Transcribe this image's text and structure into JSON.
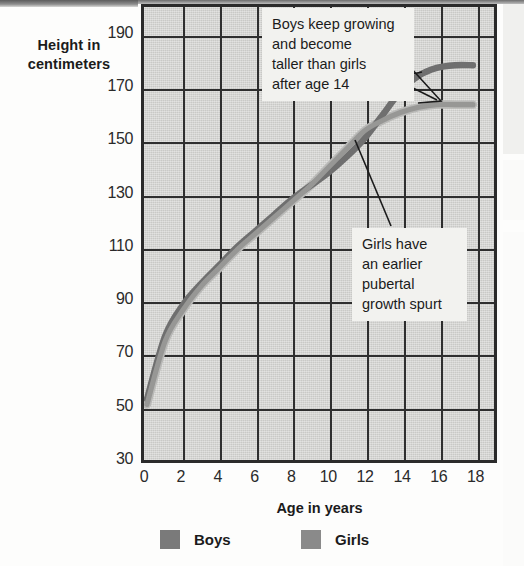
{
  "chart_data": {
    "type": "line",
    "title": "",
    "xlabel": "Age in years",
    "ylabel": "Height in centimeters",
    "xlim": [
      0,
      19
    ],
    "ylim": [
      30,
      200
    ],
    "xticks": [
      "0",
      "2",
      "4",
      "6",
      "8",
      "10",
      "12",
      "14",
      "16",
      "18"
    ],
    "yticks": [
      "190",
      "170",
      "150",
      "130",
      "110",
      "90",
      "70",
      "50",
      "30"
    ],
    "grid": true,
    "legend_position": "bottom",
    "x": [
      0,
      1,
      2,
      3,
      4,
      5,
      6,
      7,
      8,
      9,
      10,
      11,
      12,
      13,
      14,
      15,
      16,
      17,
      18
    ],
    "series": [
      {
        "name": "Boys",
        "color": "#7c7c7c",
        "values": [
          52,
          76,
          88,
          96,
          103,
          110,
          116,
          122,
          128,
          133,
          138,
          144,
          151,
          160,
          169,
          175,
          178,
          179,
          179
        ]
      },
      {
        "name": "Girls",
        "color": "#8d8d8d",
        "values": [
          50,
          74,
          86,
          95,
          102,
          109,
          115,
          121,
          127,
          133,
          140,
          147,
          154,
          158,
          161,
          163,
          164,
          164,
          164
        ]
      }
    ],
    "annotations": [
      {
        "id": "boys-note",
        "lines": [
          "Boys keep growing",
          "and become",
          "taller than girls",
          "after age 14"
        ],
        "points_to_age": 15.3,
        "points_to_height": 176
      },
      {
        "id": "girls-note",
        "lines": [
          "Girls have",
          "an earlier",
          "pubertal",
          "growth spurt"
        ],
        "points_to_age": 12.2,
        "points_to_height": 155
      }
    ]
  },
  "axes": {
    "y_title_line1": "Height in",
    "y_title_line2": "centimeters",
    "x_title": "Age in years",
    "y_ticks": [
      {
        "label": "190",
        "value": 190
      },
      {
        "label": "170",
        "value": 170
      },
      {
        "label": "150",
        "value": 150
      },
      {
        "label": "130",
        "value": 130
      },
      {
        "label": "110",
        "value": 110
      },
      {
        "label": "90",
        "value": 90
      },
      {
        "label": "70",
        "value": 70
      },
      {
        "label": "50",
        "value": 50
      },
      {
        "label": "30",
        "value": 30
      }
    ],
    "x_ticks": [
      {
        "label": "0",
        "value": 0
      },
      {
        "label": "2",
        "value": 2
      },
      {
        "label": "4",
        "value": 4
      },
      {
        "label": "6",
        "value": 6
      },
      {
        "label": "8",
        "value": 8
      },
      {
        "label": "10",
        "value": 10
      },
      {
        "label": "12",
        "value": 12
      },
      {
        "label": "14",
        "value": 14
      },
      {
        "label": "16",
        "value": 16
      },
      {
        "label": "18",
        "value": 18
      }
    ]
  },
  "callouts": {
    "boys": {
      "line1": "Boys keep growing",
      "line2": "and become",
      "line3": "taller than girls",
      "line4": "after age 14"
    },
    "girls": {
      "line1": "Girls have",
      "line2": "an earlier",
      "line3": "pubertal",
      "line4": "growth spurt"
    }
  },
  "legend": {
    "items": [
      {
        "label": "Boys",
        "color": "#7a7a7a"
      },
      {
        "label": "Girls",
        "color": "#8a8a8a"
      }
    ]
  },
  "colors": {
    "plot_background": "#c9c9c6",
    "grid": "#2e2e2e",
    "frame": "#2b2b2b",
    "boys_line": "#7c7c7c",
    "girls_line": "#9a9a9a",
    "callout_background": "#f2f2ef",
    "text": "#1b1b1b"
  }
}
